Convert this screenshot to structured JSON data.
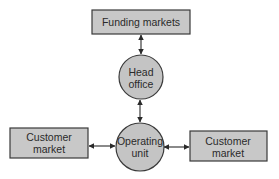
{
  "diagram": {
    "colors": {
      "node_fill": "#c8c8c8",
      "stroke": "#3a3a3a",
      "text": "#2a2a2a",
      "background": "#ffffff"
    },
    "nodes": {
      "funding_markets": {
        "shape": "rectangle",
        "line1": "Funding markets"
      },
      "head_office": {
        "shape": "circle",
        "line1": "Head",
        "line2": "office"
      },
      "operating_unit": {
        "shape": "circle",
        "line1": "Operating",
        "line2": "unit"
      },
      "customer_market_left": {
        "shape": "rectangle",
        "line1": "Customer",
        "line2": "market"
      },
      "customer_market_right": {
        "shape": "rectangle",
        "line1": "Customer",
        "line2": "market"
      }
    },
    "edges": [
      {
        "from": "funding_markets",
        "to": "head_office",
        "type": "bidirectional-arrow"
      },
      {
        "from": "head_office",
        "to": "operating_unit",
        "type": "bidirectional-arrow"
      },
      {
        "from": "customer_market_left",
        "to": "operating_unit",
        "type": "bidirectional-arrow"
      },
      {
        "from": "operating_unit",
        "to": "customer_market_right",
        "type": "bidirectional-arrow"
      }
    ]
  }
}
